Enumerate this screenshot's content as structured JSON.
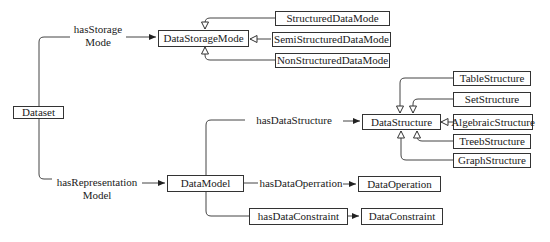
{
  "diagram": {
    "nodes": {
      "dataset": "Dataset",
      "data_storage_mode": "DataStorageMode",
      "structured_data_mode": "StructuredDataMode",
      "semi_structured_data_mode": "SemiStructuredDataMode",
      "non_structured_data_mode": "NonStructuredDataMode",
      "data_model": "DataModel",
      "data_structure": "DataStructure",
      "table_structure": "TableStructure",
      "set_structure": "SetStructure",
      "algebraic_structure": "AlgebraicStructure",
      "treeb_structure": "TreebStructure",
      "graph_structure": "GraphStructure",
      "data_operation": "DataOperation",
      "data_constraint": "DataConstraint"
    },
    "relations": {
      "has_storage_mode_line1": "hasStorage",
      "has_storage_mode_line2": "Mode",
      "has_representation_model_line1": "hasRepresentation",
      "has_representation_model_line2": "Model",
      "has_data_structure": "hasDataStructure",
      "has_data_operation": "hasDataOperration",
      "has_data_constraint": "hasDataConstraint"
    },
    "edges": [
      {
        "from": "Dataset",
        "to": "DataStorageMode",
        "label": "hasStorage Mode",
        "type": "association"
      },
      {
        "from": "Dataset",
        "to": "DataModel",
        "label": "hasRepresentation Model",
        "type": "association"
      },
      {
        "from": "StructuredDataMode",
        "to": "DataStorageMode",
        "type": "generalization"
      },
      {
        "from": "SemiStructuredDataMode",
        "to": "DataStorageMode",
        "type": "generalization"
      },
      {
        "from": "NonStructuredDataMode",
        "to": "DataStorageMode",
        "type": "generalization"
      },
      {
        "from": "DataModel",
        "to": "DataStructure",
        "label": "hasDataStructure",
        "type": "association"
      },
      {
        "from": "DataModel",
        "to": "DataOperation",
        "label": "hasDataOperration",
        "type": "association"
      },
      {
        "from": "DataModel",
        "to": "DataConstraint",
        "label": "hasDataConstraint",
        "type": "association"
      },
      {
        "from": "TableStructure",
        "to": "DataStructure",
        "type": "generalization"
      },
      {
        "from": "SetStructure",
        "to": "DataStructure",
        "type": "generalization"
      },
      {
        "from": "AlgebraicStructure",
        "to": "DataStructure",
        "type": "generalization"
      },
      {
        "from": "TreebStructure",
        "to": "DataStructure",
        "type": "generalization"
      },
      {
        "from": "GraphStructure",
        "to": "DataStructure",
        "type": "generalization"
      }
    ]
  }
}
